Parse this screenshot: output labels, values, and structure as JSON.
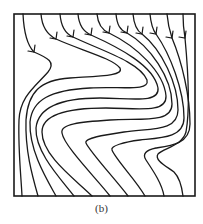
{
  "figure": {
    "caption": "(b)",
    "kind": "streamline-plot",
    "stroke_color": "#1a1a1a",
    "background": "#ffffff",
    "frame": {
      "x": 14,
      "y": 14,
      "width": 181,
      "height": 182
    },
    "streamline_count": 10,
    "streamlines": [
      {
        "id": 1,
        "path": "M23,14 C24,35 28,46 34,52 C48,58 56,62 48,72 C36,86 20,96 19,120 C18,150 21,175 22,196",
        "arrow": [
          34,
          52
        ]
      },
      {
        "id": 2,
        "path": "M41,14 C42,28 48,35 56,39 C80,50 112,58 120,68 C124,76 100,76 70,78 C40,80 28,92 26,120 C25,150 32,175 38,196",
        "arrow": [
          56,
          39
        ]
      },
      {
        "id": 3,
        "path": "M60,14 C61,27 66,34 73,37 C100,50 140,62 147,80 C150,92 120,86 90,88 C50,90 32,100 30,122 C29,150 46,178 56,196",
        "arrow": [
          73,
          37
        ]
      },
      {
        "id": 4,
        "path": "M78,14 C79,26 84,32 91,35 C120,48 154,66 158,88 C160,104 130,98 100,98 C60,98 38,108 36,128 C35,152 60,178 74,196",
        "arrow": [
          91,
          35
        ]
      },
      {
        "id": 5,
        "path": "M97,14 C98,25 102,30 109,33 C136,46 164,72 166,96 C167,114 136,108 106,108 C70,108 42,114 42,132 C42,156 76,180 92,196",
        "arrow": [
          109,
          33
        ]
      },
      {
        "id": 6,
        "path": "M116,14 C117,25 120,30 127,33 C150,46 172,78 172,104 C172,124 140,118 110,120 C80,122 60,124 62,133 C64,146 96,178 110,196",
        "arrow": [
          127,
          33
        ]
      },
      {
        "id": 7,
        "path": "M133,14 C134,25 137,31 142,34 C162,50 178,84 178,110 C178,132 150,128 124,132 C104,135 84,138 86,143 C90,152 116,180 128,196",
        "arrow": [
          142,
          34
        ]
      },
      {
        "id": 8,
        "path": "M150,14 C151,25 153,30 156,34 C170,54 184,90 184,118 C184,138 160,138 140,140 C124,142 110,146 112,150 C116,160 136,180 145,196",
        "arrow": [
          156,
          34
        ]
      },
      {
        "id": 9,
        "path": "M167,14 C168,26 170,32 172,38 C182,62 190,96 190,124 C190,144 170,146 156,148 C146,150 142,154 146,160 C154,172 162,184 164,196",
        "arrow": [
          172,
          38
        ]
      },
      {
        "id": 10,
        "path": "M183,14 C183,26 184,32 185,38 C188,70 190,110 186,132 C182,146 164,148 158,154 C154,160 166,166 174,172 C180,178 182,188 183,196",
        "arrow": [
          185,
          38
        ]
      }
    ]
  }
}
